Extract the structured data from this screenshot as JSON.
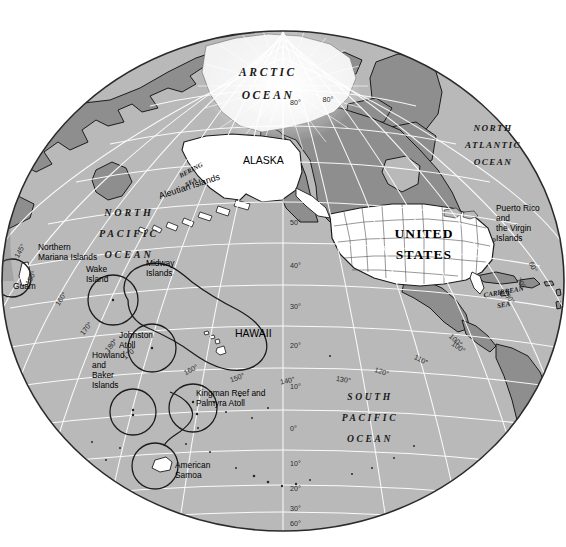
{
  "map": {
    "title": "United States and Territories",
    "projection": "orthographic-globe",
    "center_note": "Pacific-centered globe",
    "background_color": "#ffffff",
    "ocean_color": "#b9b9b9",
    "land_other_color": "#8f8f8f",
    "land_us_color": "#ffffff",
    "ice_color": "#f2f2f2",
    "graticule_color": "#ffffff",
    "coast_color": "#1c1c1c",
    "globe_edge_color": "#2a2a2a",
    "globe": {
      "center_x": 283,
      "center_y": 281,
      "radius_x": 281,
      "radius_y": 250
    }
  },
  "ocean_labels": [
    {
      "id": "arctic-ocean",
      "lines": [
        "ARCTIC",
        "OCEAN"
      ],
      "x": 268,
      "y": 76,
      "size": 11.5,
      "spacing": 2.6,
      "line_gap": 23
    },
    {
      "id": "north-atlantic-ocean",
      "lines": [
        "NORTH",
        "ATLANTIC",
        "OCEAN"
      ],
      "x": 493,
      "y": 131,
      "size": 9.2,
      "spacing": 1.4,
      "line_gap": 17
    },
    {
      "id": "north-pacific-ocean",
      "lines": [
        "NORTH",
        "PACIFIC",
        "OCEAN"
      ],
      "x": 129,
      "y": 216,
      "size": 10.2,
      "spacing": 2.8,
      "line_gap": 21
    },
    {
      "id": "south-pacific-ocean",
      "lines": [
        "SOUTH",
        "PACIFIC",
        "OCEAN"
      ],
      "x": 370,
      "y": 400,
      "size": 9.6,
      "spacing": 2.6,
      "line_gap": 21
    }
  ],
  "sea_labels": [
    {
      "id": "bering-sea",
      "lines": [
        "BERING",
        "SEA"
      ],
      "x": 192,
      "y": 172,
      "size": 6.6,
      "rotate": -28,
      "line_gap": 12
    },
    {
      "id": "caribbean-sea",
      "lines": [
        "CARIBBEAN",
        "SEA"
      ],
      "x": 504,
      "y": 294,
      "size": 7.0,
      "rotate": -10,
      "line_gap": 13
    }
  ],
  "country_labels": [
    {
      "id": "united-states",
      "lines": [
        "UNITED",
        "STATES"
      ],
      "x": 424,
      "y": 238,
      "size": 13.5,
      "spacing": 1.1,
      "line_gap": 21
    }
  ],
  "region_labels": [
    {
      "id": "alaska",
      "text": "ALASKA",
      "x": 243,
      "y": 164,
      "size": 10.5,
      "anchor": "start"
    },
    {
      "id": "hawaii",
      "text": "HAWAII",
      "x": 235,
      "y": 337,
      "size": 10.5,
      "anchor": "start"
    },
    {
      "id": "aleutian-islands",
      "text": "Aleutian Islands",
      "x": 160,
      "y": 199,
      "size": 9.0,
      "rotate": -18,
      "anchor": "start"
    }
  ],
  "island_labels": [
    {
      "id": "northern-mariana-islands",
      "lines": [
        "Northern",
        "Mariana Islands"
      ],
      "x": 38,
      "y": 250,
      "size": 8.4,
      "anchor": "start",
      "line_gap": 10
    },
    {
      "id": "guam",
      "lines": [
        "Guam"
      ],
      "x": 13,
      "y": 289,
      "size": 8.4,
      "anchor": "start",
      "line_gap": 10
    },
    {
      "id": "wake-island",
      "lines": [
        "Wake",
        "Island"
      ],
      "x": 86,
      "y": 272,
      "size": 8.4,
      "anchor": "start",
      "line_gap": 10
    },
    {
      "id": "midway-islands",
      "lines": [
        "Midway",
        "Islands"
      ],
      "x": 146,
      "y": 266,
      "size": 8.4,
      "anchor": "start",
      "line_gap": 10
    },
    {
      "id": "johnston-atoll",
      "lines": [
        "Johnston",
        "Atoll"
      ],
      "x": 119,
      "y": 338,
      "size": 8.4,
      "anchor": "start",
      "line_gap": 10
    },
    {
      "id": "howland-and-baker-islands",
      "lines": [
        "Howland",
        "and",
        "Baker",
        "Islands"
      ],
      "x": 92,
      "y": 358,
      "size": 8.4,
      "anchor": "start",
      "line_gap": 10
    },
    {
      "id": "kingman-reef-and-palmyra-atoll",
      "lines": [
        "Kingman Reef and",
        "Palmyra Atoll"
      ],
      "x": 196,
      "y": 396,
      "size": 8.4,
      "anchor": "start",
      "line_gap": 10
    },
    {
      "id": "american-samoa",
      "lines": [
        "American",
        "Samoa"
      ],
      "x": 175,
      "y": 468,
      "size": 8.4,
      "anchor": "start",
      "line_gap": 10
    },
    {
      "id": "puerto-rico-and-the-virgin-islands",
      "lines": [
        "Puerto Rico",
        "and",
        "the Virgin",
        "Islands"
      ],
      "x": 496,
      "y": 211,
      "size": 8.4,
      "anchor": "start",
      "line_gap": 10
    }
  ],
  "graticule": {
    "latitude_labels": [
      {
        "value": "80°",
        "x": 290,
        "y": 105
      },
      {
        "value": "50°",
        "x": 290,
        "y": 225
      },
      {
        "value": "40°",
        "x": 290,
        "y": 268
      },
      {
        "value": "30°",
        "x": 290,
        "y": 309
      },
      {
        "value": "20°",
        "x": 290,
        "y": 348
      },
      {
        "value": "10°",
        "x": 290,
        "y": 389
      },
      {
        "value": "0°",
        "x": 290,
        "y": 431
      },
      {
        "value": "10°",
        "x": 290,
        "y": 466
      },
      {
        "value": "20°",
        "x": 290,
        "y": 491
      },
      {
        "value": "30°",
        "x": 290,
        "y": 511
      },
      {
        "value": "60°",
        "x": 290,
        "y": 526
      }
    ],
    "longitude_labels": [
      {
        "value": "145°",
        "x": 22,
        "y": 252,
        "rotate": -62
      },
      {
        "value": "150°",
        "x": 33,
        "y": 279,
        "rotate": -62
      },
      {
        "value": "160°",
        "x": 63,
        "y": 300,
        "rotate": -58
      },
      {
        "value": "170°",
        "x": 88,
        "y": 330,
        "rotate": -52
      },
      {
        "value": "180°",
        "x": 113,
        "y": 347,
        "rotate": -48
      },
      {
        "value": "170°",
        "x": 131,
        "y": 355,
        "rotate": -40
      },
      {
        "value": "160°",
        "x": 192,
        "y": 372,
        "rotate": -28
      },
      {
        "value": "150°",
        "x": 238,
        "y": 380,
        "rotate": -20
      },
      {
        "value": "140°",
        "x": 288,
        "y": 383,
        "rotate": -12
      },
      {
        "value": "130°",
        "x": 343,
        "y": 382,
        "rotate": 10
      },
      {
        "value": "120°",
        "x": 381,
        "y": 374,
        "rotate": 18
      },
      {
        "value": "110°",
        "x": 420,
        "y": 362,
        "rotate": 26
      },
      {
        "value": "100°",
        "x": 457,
        "y": 349,
        "rotate": 36
      },
      {
        "value": "100°",
        "x": 454,
        "y": 342,
        "rotate": 42
      },
      {
        "value": "70°",
        "x": 519,
        "y": 284,
        "rotate": 58
      },
      {
        "value": "80°",
        "x": 508,
        "y": 300,
        "rotate": 54
      },
      {
        "value": "60°",
        "x": 531,
        "y": 268,
        "rotate": 62
      },
      {
        "value": "80°",
        "x": 328,
        "y": 102,
        "rotate": 0
      }
    ]
  },
  "territory_circles": [
    {
      "id": "circle-northern-mariana",
      "cx": 12,
      "cy": 278,
      "r": 19
    },
    {
      "id": "circle-wake-island",
      "cx": 113,
      "cy": 300,
      "r": 25
    },
    {
      "id": "circle-johnston-atoll",
      "cx": 152,
      "cy": 348,
      "r": 24
    },
    {
      "id": "circle-howland-baker",
      "cx": 133,
      "cy": 412,
      "r": 23
    },
    {
      "id": "circle-kingman-palmyra",
      "cx": 193,
      "cy": 408,
      "r": 24
    },
    {
      "id": "circle-american-samoa",
      "cx": 155,
      "cy": 466,
      "r": 23
    }
  ]
}
